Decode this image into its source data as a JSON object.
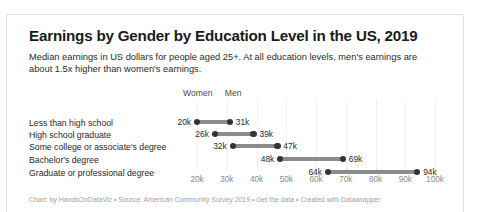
{
  "chart_data": {
    "type": "dumbbell",
    "title": "Earnings by Gender by Education Level in the US, 2019",
    "subtitle": "Median earnings in US dollars for people aged 25+. At all education levels, men's earnings are about 1.5x higher than women's earnings.",
    "xlabel": "",
    "ylabel": "",
    "grid": true,
    "legend_position": "top",
    "xlim": [
      20000,
      100000
    ],
    "xtick_labels": [
      "20k",
      "30k",
      "40k",
      "50k",
      "60k",
      "70k",
      "80k",
      "90k",
      "100k"
    ],
    "xtick_values": [
      20000,
      30000,
      40000,
      50000,
      60000,
      70000,
      80000,
      90000,
      100000
    ],
    "legend": [
      {
        "name": "Women",
        "color": "#333333"
      },
      {
        "name": "Men",
        "color": "#333333"
      }
    ],
    "categories": [
      "Less than high school",
      "High school graduate",
      "Some college or associate's degree",
      "Bachelor's degree",
      "Graduate or professional degree"
    ],
    "series": [
      {
        "name": "Women",
        "values": [
          20000,
          26000,
          32000,
          48000,
          64000
        ],
        "labels": [
          "20k",
          "26k",
          "32k",
          "48k",
          "64k"
        ]
      },
      {
        "name": "Men",
        "values": [
          31000,
          39000,
          47000,
          69000,
          94000
        ],
        "labels": [
          "31k",
          "39k",
          "47k",
          "69k",
          "94k"
        ]
      }
    ],
    "footer": "Chart: by HandsOnDataViz • Source: American Community Survey 2019 • Get the data • Created with Datawrapper",
    "colors": {
      "dot": "#333333",
      "connector": "#8c8c8c",
      "gridline": "#f0f0f0",
      "title": "#1a1a1a",
      "footer": "#a0a0a0"
    }
  }
}
